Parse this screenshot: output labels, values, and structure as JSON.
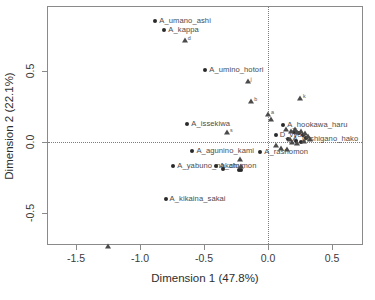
{
  "chart_data": {
    "type": "scatter",
    "title": "",
    "xlabel": "Dimension 1 (47.8%)",
    "ylabel": "Dimension 2 (22.1%)",
    "xlim": [
      -1.72,
      0.74
    ],
    "ylim": [
      -0.82,
      0.93
    ],
    "xticks": [
      -1.5,
      -1.0,
      -0.5,
      0.0,
      0.5
    ],
    "xticklabels": [
      "-1.5",
      "-1.0",
      "-0.5",
      "0.0",
      "0.5"
    ],
    "yticks": [
      0.5,
      0.0,
      -0.5
    ],
    "yticklabels": [
      "0.5",
      "0.0",
      "-0.5"
    ],
    "grid": false,
    "reference_lines": {
      "h": 0.0,
      "v": 0.0,
      "style": "dotted"
    },
    "legend": "none",
    "series": [
      {
        "name": "row-points",
        "marker": "circle",
        "points": [
          {
            "label": "A_umano_ashi",
            "x": -0.88,
            "y": 0.85
          },
          {
            "label": "A_kappa",
            "x": -0.81,
            "y": 0.79
          },
          {
            "label": "A_umino_hotori",
            "x": -0.49,
            "y": 0.51
          },
          {
            "label": "A_issekiwa",
            "x": -0.63,
            "y": 0.13
          },
          {
            "label": "A_agunino_kami",
            "x": -0.59,
            "y": -0.06
          },
          {
            "label": "A_yabuno_nakato",
            "x": -0.74,
            "y": -0.17
          },
          {
            "label": "A_chumon",
            "x": -0.41,
            "y": -0.17
          },
          {
            "label": "A_kikaina_sakai",
            "x": -0.8,
            "y": -0.4
          },
          {
            "label": "A_rashomon",
            "x": -0.06,
            "y": -0.07
          },
          {
            "label": "A_hookawa_haru",
            "x": 0.12,
            "y": 0.12
          },
          {
            "label": "A_mishigano_hako",
            "x": 0.16,
            "y": 0.02
          },
          {
            "label": "D_vyon",
            "x": 0.06,
            "y": 0.05
          },
          {
            "label": "",
            "x": -0.35,
            "y": -0.19
          },
          {
            "label": "",
            "x": -0.23,
            "y": -0.2
          },
          {
            "label": "",
            "x": -0.21,
            "y": -0.2
          },
          {
            "label": "",
            "x": 0.2,
            "y": 0.07
          },
          {
            "label": "",
            "x": 0.24,
            "y": 0.06
          },
          {
            "label": "",
            "x": 0.27,
            "y": 0.05
          },
          {
            "label": "",
            "x": 0.3,
            "y": 0.03
          },
          {
            "label": "",
            "x": 0.22,
            "y": 0.01
          },
          {
            "label": "",
            "x": 0.26,
            "y": 0.0
          }
        ]
      },
      {
        "name": "column-points",
        "marker": "triangle",
        "points": [
          {
            "label": "d",
            "x": -0.65,
            "y": 0.72
          },
          {
            "label": "j",
            "x": -0.16,
            "y": 0.43
          },
          {
            "label": "b",
            "x": -0.13,
            "y": 0.29
          },
          {
            "label": "a",
            "x": 0.0,
            "y": 0.2
          },
          {
            "label": "s",
            "x": -0.32,
            "y": 0.07
          },
          {
            "label": "k",
            "x": 0.25,
            "y": 0.31
          },
          {
            "label": "",
            "x": -1.25,
            "y": -0.73
          },
          {
            "label": "",
            "x": -0.22,
            "y": -0.12
          },
          {
            "label": "",
            "x": -0.21,
            "y": -0.17
          },
          {
            "label": "",
            "x": 0.02,
            "y": 0.16
          },
          {
            "label": "",
            "x": 0.14,
            "y": 0.09
          },
          {
            "label": "",
            "x": 0.18,
            "y": 0.08
          },
          {
            "label": "",
            "x": 0.21,
            "y": 0.09
          },
          {
            "label": "",
            "x": 0.23,
            "y": 0.07
          },
          {
            "label": "",
            "x": 0.26,
            "y": 0.08
          },
          {
            "label": "",
            "x": 0.29,
            "y": 0.06
          },
          {
            "label": "",
            "x": 0.31,
            "y": 0.04
          },
          {
            "label": "",
            "x": 0.17,
            "y": 0.02
          },
          {
            "label": "",
            "x": 0.19,
            "y": 0.0
          },
          {
            "label": "",
            "x": 0.23,
            "y": -0.01
          },
          {
            "label": "",
            "x": 0.28,
            "y": 0.01
          },
          {
            "label": "",
            "x": 0.33,
            "y": 0.02
          },
          {
            "label": "",
            "x": 0.1,
            "y": -0.04
          },
          {
            "label": "",
            "x": 0.15,
            "y": -0.05
          },
          {
            "label": "",
            "x": 0.06,
            "y": -0.02
          }
        ]
      }
    ],
    "cluster_labels_right": [
      "A_hookawa_haru",
      "A_mishigano_hako",
      "A_ikeno_shin",
      "D_vyon"
    ]
  },
  "colors": {
    "frame": "#8a8a8a",
    "point": "#2a2a2a",
    "triangle": "#4a4a4a",
    "label": "#4b4b4b",
    "refline": "#7d7d7d",
    "background": "#ffffff"
  }
}
